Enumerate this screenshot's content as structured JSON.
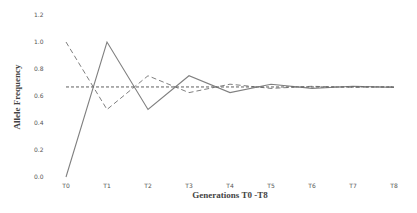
{
  "chart_data": {
    "type": "line",
    "title": "",
    "xlabel": "Generations T0 -T8",
    "ylabel": "Allele Frequency",
    "categories": [
      "T0",
      "T1",
      "T2",
      "T3",
      "T4",
      "T5",
      "T6",
      "T7",
      "T8"
    ],
    "yticks": [
      "0.0",
      "0.2",
      "0.4",
      "0.6",
      "0.8",
      "1.0",
      "1.2"
    ],
    "ylim": [
      0,
      1.2
    ],
    "grid": false,
    "legend": null,
    "series": [
      {
        "name": "Population A (solid)",
        "style": "solid",
        "color": "#808080",
        "values": [
          0.0,
          1.0,
          0.5,
          0.75,
          0.625,
          0.6875,
          0.65625,
          0.671875,
          0.664
        ]
      },
      {
        "name": "Population B (dashed)",
        "style": "dashed",
        "color": "#808080",
        "values": [
          1.0,
          0.5,
          0.75,
          0.625,
          0.6875,
          0.65625,
          0.671875,
          0.664,
          0.668
        ]
      },
      {
        "name": "Equilibrium (dotted)",
        "style": "dotted",
        "color": "#606060",
        "values": [
          0.667,
          0.667,
          0.667,
          0.667,
          0.667,
          0.667,
          0.667,
          0.667,
          0.667
        ]
      }
    ]
  }
}
